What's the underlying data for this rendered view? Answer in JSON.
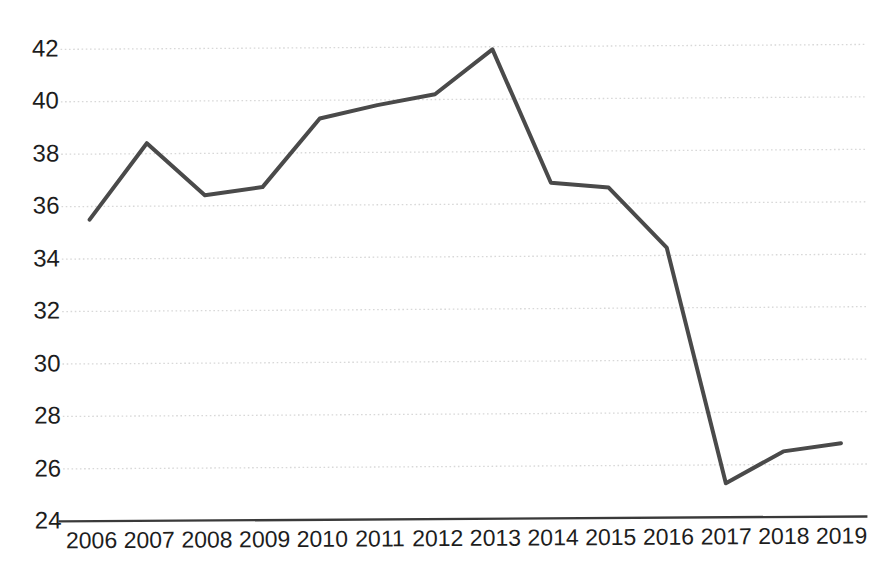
{
  "chart_data": {
    "type": "line",
    "title": "",
    "subtitle": "",
    "xlabel": "",
    "ylabel": "",
    "categories": [
      "2006",
      "2007",
      "2008",
      "2009",
      "2010",
      "2011",
      "2012",
      "2013",
      "2014",
      "2015",
      "2016",
      "2017",
      "2018",
      "2019"
    ],
    "values": [
      35.5,
      38.4,
      36.4,
      36.7,
      39.3,
      39.8,
      40.2,
      41.9,
      36.8,
      36.6,
      34.3,
      25.3,
      26.5,
      26.8
    ],
    "series": [
      {
        "name": "",
        "values": [
          35.5,
          38.4,
          36.4,
          36.7,
          39.3,
          39.8,
          40.2,
          41.9,
          36.8,
          36.6,
          34.3,
          25.3,
          26.5,
          26.8
        ]
      }
    ],
    "y_ticks": [
      24,
      26,
      28,
      30,
      32,
      34,
      36,
      38,
      40,
      42
    ],
    "y_tick_labels": [
      "24",
      "26",
      "28",
      "30",
      "32",
      "34",
      "36",
      "38",
      "40",
      "42"
    ],
    "ylim": [
      24,
      42
    ],
    "xlim": [
      2006,
      2019
    ],
    "grid": true,
    "grid_axis": "y",
    "grid_style": "dotted",
    "legend": false,
    "legend_position": "none",
    "markers": false,
    "annotations": []
  },
  "style": {
    "line_color": "#4a4a4a",
    "line_width": 4,
    "grid_color": "#d8d8d8",
    "axis_color": "#3a3a3a",
    "label_color": "#1d1d1d",
    "background": "#ffffff"
  }
}
